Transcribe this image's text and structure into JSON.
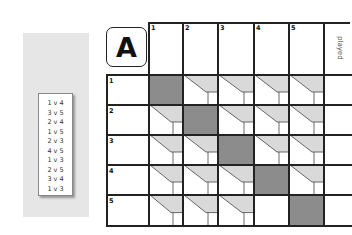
{
  "panel": {
    "fixtures": [
      "1 v 4",
      "3 v 5",
      "2 v 4",
      "1 v 5",
      "2 v 3",
      "4 v 5",
      "1 v 3",
      "2 v 5",
      "3 v 4",
      "1 v 3"
    ]
  },
  "table": {
    "group_letter": "A",
    "columns": [
      "1",
      "2",
      "3",
      "4",
      "5"
    ],
    "played_header": "played",
    "rows": [
      {
        "label": "1",
        "cells": [
          "self",
          "result",
          "result",
          "result",
          "result"
        ]
      },
      {
        "label": "2",
        "cells": [
          "result",
          "self",
          "result",
          "result",
          "result"
        ]
      },
      {
        "label": "3",
        "cells": [
          "result",
          "result",
          "self",
          "result",
          "result"
        ]
      },
      {
        "label": "4",
        "cells": [
          "result",
          "result",
          "result",
          "self",
          "result"
        ]
      },
      {
        "label": "5",
        "cells": [
          "result",
          "result",
          "result",
          "empty",
          "self"
        ]
      }
    ]
  },
  "colors": {
    "self_cell": "#8c8c8c",
    "result_fill": "#d9d9d9",
    "grid_line": "#222222",
    "panel_bg": "#e6e6e6"
  }
}
